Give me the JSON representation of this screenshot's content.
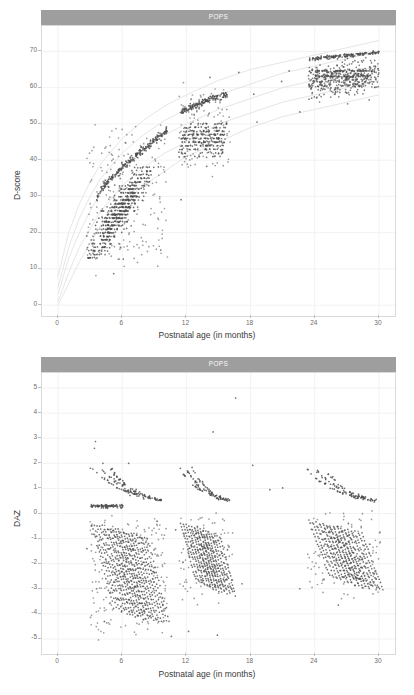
{
  "figure": {
    "background": "#ffffff",
    "point_color": "#4d4d4d",
    "grid_color": "#f0f0f0",
    "strip_fill": "#9e9e9e",
    "strip_text_color": "#ffffff",
    "reference_curve_color": "#e2e2e2"
  },
  "panels": [
    {
      "id": "dscore",
      "strip_label": "POPS",
      "ylabel": "D-score",
      "xlabel": "Postnatal age (in months)"
    },
    {
      "id": "daz",
      "strip_label": "POPS",
      "ylabel": "DAZ",
      "xlabel": "Postnatal age (in months)"
    }
  ],
  "chart_data": [
    {
      "type": "scatter",
      "id": "dscore",
      "title": "POPS",
      "xlabel": "Postnatal age (in months)",
      "ylabel": "D-score",
      "xlim": [
        -1.5,
        31.5
      ],
      "ylim": [
        -3,
        77
      ],
      "xticks": [
        0,
        6,
        12,
        18,
        24,
        30
      ],
      "xtick_labels": [
        "0",
        "6",
        "12",
        "18",
        "24",
        "30"
      ],
      "yticks": [
        0,
        10,
        20,
        30,
        40,
        50,
        60,
        70
      ],
      "ytick_labels": [
        "0",
        "10",
        "20",
        "30",
        "40",
        "50",
        "60",
        "70"
      ],
      "grid": true,
      "legend": "none",
      "reference_curves": {
        "description": "Faint D-score-for-age reference centiles (-2SD, -1SD, 0SD, +1SD, +2SD) rising steeply then flattening",
        "color": "#e2e2e2",
        "centiles": [
          {
            "name": "+2SD",
            "x": [
              0,
              1,
              2,
              3,
              4,
              6,
              8,
              10,
              12,
              15,
              18,
              21,
              24,
              27,
              30
            ],
            "y": [
              8,
              20,
              28,
              34,
              39,
              46,
              51,
              55,
              58,
              62,
              65,
              67,
              69,
              71,
              73
            ]
          },
          {
            "name": "+1SD",
            "x": [
              0,
              1,
              2,
              3,
              4,
              6,
              8,
              10,
              12,
              15,
              18,
              21,
              24,
              27,
              30
            ],
            "y": [
              5,
              16,
              24,
              30,
              35,
              42,
              47,
              51,
              54,
              58,
              61,
              64,
              66,
              68,
              70
            ]
          },
          {
            "name": "0SD",
            "x": [
              0,
              1,
              2,
              3,
              4,
              6,
              8,
              10,
              12,
              15,
              18,
              21,
              24,
              27,
              30
            ],
            "y": [
              3,
              13,
              20,
              26,
              31,
              38,
              43,
              47,
              50,
              54,
              57,
              60,
              62,
              64,
              66
            ]
          },
          {
            "name": "-1SD",
            "x": [
              0,
              1,
              2,
              3,
              4,
              6,
              8,
              10,
              12,
              15,
              18,
              21,
              24,
              27,
              30
            ],
            "y": [
              1,
              9,
              16,
              21,
              26,
              33,
              38,
              42,
              45,
              50,
              53,
              56,
              58,
              60,
              62
            ]
          },
          {
            "name": "-2SD",
            "x": [
              0,
              1,
              2,
              3,
              4,
              6,
              8,
              10,
              12,
              15,
              18,
              21,
              24,
              27,
              30
            ],
            "y": [
              0,
              6,
              12,
              17,
              22,
              28,
              33,
              37,
              41,
              45,
              49,
              52,
              54,
              56,
              58
            ]
          }
        ]
      },
      "clusters": [
        {
          "name": "wave-1",
          "x_range": [
            2.6,
            10.6
          ],
          "y_range": [
            8,
            48
          ],
          "n": 700,
          "note": "horizontal bands of discrete D-scores between 13 and 38, plus an upper rising arc from 30 to 48"
        },
        {
          "name": "wave-2",
          "x_range": [
            11.3,
            16.0
          ],
          "y_range": [
            38,
            58
          ],
          "n": 380,
          "note": "dense horizontal bands near 43-50 with an upper arc rising from 53 to 58"
        },
        {
          "name": "wave-3",
          "x_range": [
            23.3,
            30.2
          ],
          "y_range": [
            55,
            71
          ],
          "n": 420,
          "note": "dense cloud 58-66 with an upper band near 68-70"
        }
      ],
      "outliers": [
        {
          "x": 5.2,
          "y": 8.7
        },
        {
          "x": 6.1,
          "y": 12.7
        },
        {
          "x": 3.4,
          "y": 13.2
        },
        {
          "x": 9.6,
          "y": 15.2
        },
        {
          "x": 4.3,
          "y": 15.9
        },
        {
          "x": 14.2,
          "y": 62.8
        },
        {
          "x": 18.3,
          "y": 58.2
        },
        {
          "x": 18.6,
          "y": 50.5
        },
        {
          "x": 20.9,
          "y": 61.7
        },
        {
          "x": 22.6,
          "y": 53.3
        },
        {
          "x": 21.6,
          "y": 64.6
        },
        {
          "x": 16.9,
          "y": 64.2
        },
        {
          "x": 13.9,
          "y": 38.3
        },
        {
          "x": 11.5,
          "y": 29.1
        }
      ]
    },
    {
      "type": "scatter",
      "id": "daz",
      "title": "POPS",
      "xlabel": "Postnatal age (in months)",
      "ylabel": "DAZ",
      "xlim": [
        -1.5,
        31.5
      ],
      "ylim": [
        -5.6,
        5.6
      ],
      "xticks": [
        0,
        6,
        12,
        18,
        24,
        30
      ],
      "xtick_labels": [
        "0",
        "6",
        "12",
        "18",
        "24",
        "30"
      ],
      "yticks": [
        -5,
        -4,
        -3,
        -2,
        -1,
        0,
        1,
        2,
        3,
        4,
        5
      ],
      "ytick_labels": [
        "-5",
        "-4",
        "-3",
        "-2",
        "-1",
        "0",
        "1",
        "2",
        "3",
        "4",
        "5"
      ],
      "grid": true,
      "legend": "none",
      "clusters": [
        {
          "name": "wave-1-upper",
          "x_range": [
            3.0,
            10.0
          ],
          "y_range": [
            0.2,
            1.7
          ],
          "n": 120,
          "note": "decaying arcs starting near 1.6 at 4 months falling toward 0.3 by 9 months, plus a flat band at 0.3"
        },
        {
          "name": "wave-1-lower",
          "x_range": [
            3.2,
            10.2
          ],
          "y_range": [
            -5.0,
            0.2
          ],
          "n": 600,
          "note": "dense diagonal striping descending from about -0.4 to -4.6"
        },
        {
          "name": "wave-2-upper",
          "x_range": [
            11.4,
            17.5
          ],
          "y_range": [
            0.1,
            1.7
          ],
          "n": 90,
          "note": "decaying arc from 1.5 to 0.3"
        },
        {
          "name": "wave-2-lower",
          "x_range": [
            11.5,
            16.2
          ],
          "y_range": [
            -4.9,
            0.0
          ],
          "n": 300,
          "note": "diagonal striping descending from -0.3 to -3.2"
        },
        {
          "name": "wave-3-upper",
          "x_range": [
            23.3,
            30.2
          ],
          "y_range": [
            0.0,
            1.5
          ],
          "n": 110,
          "note": "descending band from 1.45 at 24 months to 0.3 at 30 months"
        },
        {
          "name": "wave-3-lower",
          "x_range": [
            23.3,
            30.2
          ],
          "y_range": [
            -3.8,
            0.0
          ],
          "n": 320,
          "note": "diagonal striping from -0.2 down to -3.0"
        }
      ],
      "outliers": [
        {
          "x": 3.5,
          "y": 2.87
        },
        {
          "x": 3.4,
          "y": 2.6
        },
        {
          "x": 4.2,
          "y": 2.0
        },
        {
          "x": 6.6,
          "y": 2.0
        },
        {
          "x": 14.5,
          "y": 3.25
        },
        {
          "x": 12.2,
          "y": 1.65
        },
        {
          "x": 18.2,
          "y": 1.92
        },
        {
          "x": 2.7,
          "y": -1.4
        },
        {
          "x": 3.6,
          "y": -3.0
        },
        {
          "x": 11.0,
          "y": -0.65
        },
        {
          "x": 12.2,
          "y": -4.7
        },
        {
          "x": 14.9,
          "y": -4.85
        },
        {
          "x": 22.6,
          "y": -3.0
        },
        {
          "x": 26.2,
          "y": -3.65
        },
        {
          "x": 16.3,
          "y": -2.65
        },
        {
          "x": 17.2,
          "y": -2.8
        },
        {
          "x": 10.6,
          "y": -4.9
        },
        {
          "x": 16.6,
          "y": 4.6
        },
        {
          "x": 19.8,
          "y": 0.95
        },
        {
          "x": 21.0,
          "y": 1.02
        }
      ]
    }
  ]
}
